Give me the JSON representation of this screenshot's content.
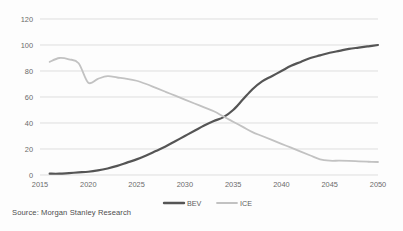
{
  "source_note": "Source: Morgan Stanley Research",
  "legend": {
    "items": [
      {
        "label": "BEV",
        "color": "#555555"
      },
      {
        "label": "ICE",
        "color": "#c2c2c2"
      }
    ]
  },
  "chart_data": {
    "type": "line",
    "title": "",
    "subtitle": "",
    "xlabel": "",
    "ylabel": "",
    "xlim": [
      2015,
      2050
    ],
    "ylim": [
      0,
      120
    ],
    "grid": true,
    "legend_position": "bottom",
    "xticks": [
      "2015",
      "2020",
      "2025",
      "2030",
      "2035",
      "2040",
      "2045",
      "2050"
    ],
    "yticks": [
      "0",
      "20",
      "40",
      "60",
      "80",
      "100",
      "120"
    ],
    "x": [
      2016,
      2017,
      2018,
      2019,
      2020,
      2021,
      2022,
      2023,
      2024,
      2025,
      2026,
      2027,
      2028,
      2029,
      2030,
      2031,
      2032,
      2033,
      2034,
      2035,
      2036,
      2037,
      2038,
      2039,
      2040,
      2041,
      2042,
      2043,
      2044,
      2045,
      2046,
      2047,
      2048,
      2049,
      2050
    ],
    "series": [
      {
        "name": "BEV",
        "color": "#555555",
        "width": 2.2,
        "values": [
          1,
          1,
          1.5,
          2,
          2.5,
          3.5,
          5,
          7,
          9.5,
          12,
          15,
          18.5,
          22,
          26,
          30,
          34,
          38,
          41.5,
          44.5,
          50,
          58,
          66,
          72,
          76,
          80,
          84,
          87,
          90,
          92,
          94,
          95.5,
          97,
          98,
          99,
          100
        ]
      },
      {
        "name": "ICE",
        "color": "#c2c2c2",
        "width": 1.8,
        "values": [
          87,
          90,
          89,
          86,
          71,
          74,
          76,
          75,
          74,
          72.5,
          70,
          67,
          64,
          61,
          58,
          55,
          52,
          49,
          45,
          41,
          37,
          33,
          30,
          27,
          24,
          21,
          18,
          15,
          12,
          11,
          11,
          10.8,
          10.5,
          10.2,
          10
        ]
      }
    ]
  }
}
